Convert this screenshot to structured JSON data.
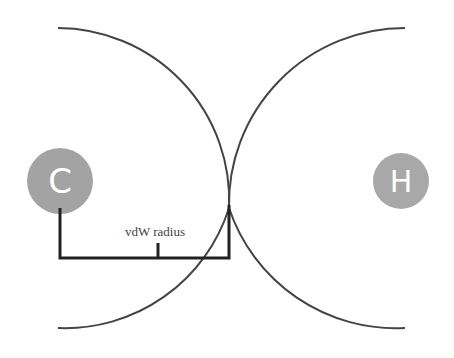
{
  "diagram": {
    "atoms": [
      {
        "symbol": "C",
        "color": "#a3a3a3"
      },
      {
        "symbol": "H",
        "color": "#a8a8a8"
      }
    ],
    "bracket_label": "vdW radius",
    "line_color": "#333333"
  }
}
